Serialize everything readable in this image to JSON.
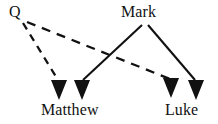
{
  "diagram": {
    "background_color": "#ffffff",
    "stroke_color": "#111111",
    "nodes": [
      {
        "id": "q",
        "label": "Q",
        "x": 22,
        "y": 16
      },
      {
        "id": "mark",
        "label": "Mark",
        "x": 144,
        "y": 16
      },
      {
        "id": "matthew",
        "label": "Matthew",
        "x": 73,
        "y": 109
      },
      {
        "id": "luke",
        "label": "Luke",
        "x": 184,
        "y": 109
      }
    ],
    "edges": [
      {
        "id": "q-to-matthew",
        "from": "Q",
        "to": "Matthew",
        "style": "dashed",
        "arrowhead": "filled-triangle",
        "x1": 23,
        "y1": 23,
        "x2": 59,
        "y2": 82
      },
      {
        "id": "q-to-luke",
        "from": "Q",
        "to": "Luke",
        "style": "dashed",
        "arrowhead": "filled-triangle",
        "x1": 26,
        "y1": 22,
        "x2": 171,
        "y2": 80
      },
      {
        "id": "mark-to-matthew",
        "from": "Mark",
        "to": "Matthew",
        "style": "solid",
        "arrowhead": "filled-triangle",
        "x1": 142,
        "y1": 24,
        "x2": 82,
        "y2": 82
      },
      {
        "id": "mark-to-luke",
        "from": "Mark",
        "to": "Luke",
        "style": "solid",
        "arrowhead": "filled-triangle",
        "x1": 148,
        "y1": 24,
        "x2": 196,
        "y2": 82
      }
    ],
    "arrowheads": [
      {
        "id": "arrow-q-matthew",
        "target": "Matthew",
        "cx": 59,
        "cy": 90
      },
      {
        "id": "arrow-mark-matthew",
        "target": "Matthew",
        "cx": 82,
        "cy": 90
      },
      {
        "id": "arrow-q-luke",
        "target": "Luke",
        "cx": 171,
        "cy": 88
      },
      {
        "id": "arrow-mark-luke",
        "target": "Luke",
        "cx": 196,
        "cy": 90
      }
    ]
  }
}
